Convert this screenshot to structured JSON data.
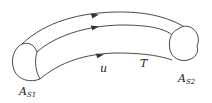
{
  "diagram": {
    "type": "stream-tube",
    "labels": {
      "inlet_area": "A",
      "inlet_area_sub": "S1",
      "outlet_area": "A",
      "outlet_area_sub": "S2",
      "velocity": "u",
      "tube": "T"
    },
    "streamlines": 3,
    "arrow_direction": "left-to-right",
    "stroke_color": "#333333"
  }
}
